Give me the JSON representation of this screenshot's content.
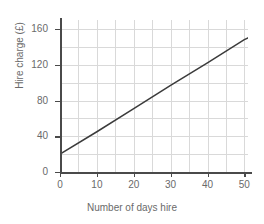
{
  "chart_data": {
    "type": "line",
    "title": "",
    "subtitle": "",
    "xlabel": "Number of days hire",
    "ylabel": "Hire charge (£)",
    "xlim": [
      0,
      51
    ],
    "ylim": [
      0,
      170
    ],
    "grid": true,
    "legend": null,
    "line_color": "#3b3b3b",
    "grid_color": "#d9d9d9",
    "axis_color": "#4a4a4a",
    "text_color": "#6a6a6a",
    "x_ticks": [
      0,
      10,
      20,
      30,
      40,
      50
    ],
    "x_tick_labels": [
      "0",
      "10",
      "20",
      "30",
      "40",
      "50"
    ],
    "x_minor_step": 5,
    "y_ticks": [
      0,
      40,
      80,
      120,
      160
    ],
    "y_tick_labels": [
      "0",
      "40",
      "80",
      "120",
      "160"
    ],
    "y_minor_step": 20,
    "series": [
      {
        "name": "Hire charge",
        "x": [
          0,
          51
        ],
        "y": [
          20,
          150
        ],
        "intercept": 20,
        "slope": 2.55,
        "points": [
          {
            "x": 0,
            "y": 20
          },
          {
            "x": 10,
            "y": 45
          },
          {
            "x": 20,
            "y": 71
          },
          {
            "x": 30,
            "y": 97
          },
          {
            "x": 40,
            "y": 122
          },
          {
            "x": 50,
            "y": 148
          },
          {
            "x": 51,
            "y": 150
          }
        ]
      }
    ]
  },
  "axis": {
    "y_title": "Hire charge (£)",
    "x_title": "Number of days hire"
  }
}
